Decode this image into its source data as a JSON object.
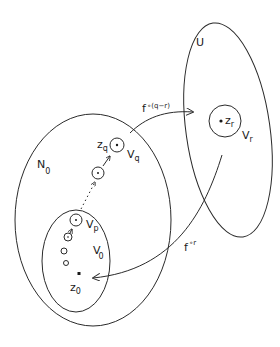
{
  "diagram": {
    "type": "set-mapping-diagram",
    "regions": [
      {
        "id": "U",
        "label": "U"
      },
      {
        "id": "N0",
        "label": "N",
        "subscript": "0"
      },
      {
        "id": "V0",
        "label": "V",
        "subscript": "0"
      }
    ],
    "neighborhoods": [
      {
        "id": "Vq",
        "label": "V",
        "subscript": "q",
        "point": {
          "label": "z",
          "subscript": "q"
        }
      },
      {
        "id": "Vp",
        "label": "V",
        "subscript": "p"
      },
      {
        "id": "Vr",
        "label": "V",
        "subscript": "r",
        "point": {
          "label": "z",
          "subscript": "r"
        }
      }
    ],
    "points": [
      {
        "id": "z0",
        "label": "z",
        "subscript": "0"
      }
    ],
    "arrows": [
      {
        "id": "f-q-minus-r",
        "from": "Vq",
        "to": "Vr",
        "label": "f",
        "superscript": "∘(q−r)"
      },
      {
        "id": "f-r",
        "from": "U",
        "to": "z0",
        "label": "f",
        "superscript": "∘r"
      }
    ],
    "stroke_color": "#2a2a2a",
    "background": "#ffffff"
  }
}
